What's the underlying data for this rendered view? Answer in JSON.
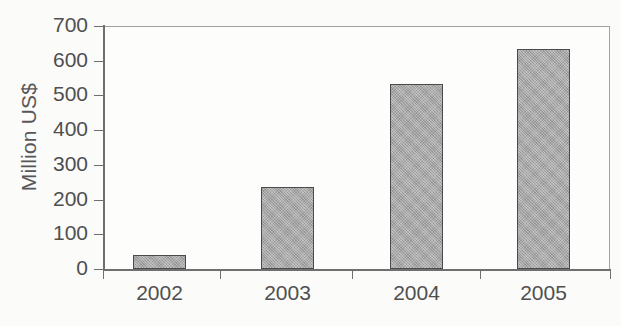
{
  "chart_data": {
    "type": "bar",
    "title": "",
    "xlabel": "",
    "ylabel": "Million US$",
    "categories": [
      "2002",
      "2003",
      "2004",
      "2005"
    ],
    "values": [
      40,
      237,
      532,
      635
    ],
    "ylim": [
      0,
      700
    ],
    "y_ticks": [
      0,
      100,
      200,
      300,
      400,
      500,
      600,
      700
    ],
    "y_tick_labels": [
      "0",
      "100",
      "200",
      "300",
      "400",
      "500",
      "600",
      "700"
    ],
    "grid": false,
    "legend": null,
    "series": [
      {
        "name": "Million US$",
        "values": [
          40,
          237,
          532,
          635
        ]
      }
    ],
    "bar_color": "#a3a3a3",
    "bar_border_color": "#4b4b4b",
    "axis_color": "#6f6f6f",
    "background_color": "#fbfbfa"
  }
}
